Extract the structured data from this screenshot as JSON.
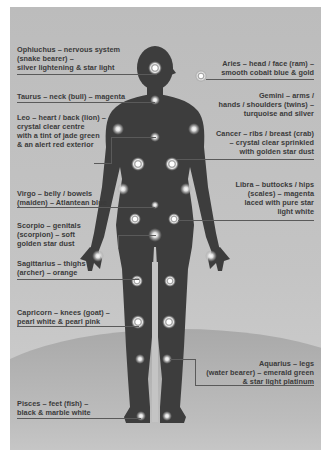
{
  "diagram": {
    "type": "zodiac-body-chakra-map",
    "colors": {
      "background": "#c2c2c2",
      "silhouette": "#3d3d3d",
      "text": "#3a3a3a",
      "leader_line": "#5a5a5a",
      "glow": "#ffffff"
    },
    "labels_left": [
      {
        "id": "ophiuchus",
        "lines": [
          "Ophiuchus – nervous system",
          "(snake bearer) –",
          "silver lightening & star light"
        ]
      },
      {
        "id": "taurus",
        "lines": [
          "Taurus – neck (bull) – magenta"
        ]
      },
      {
        "id": "leo",
        "lines": [
          "Leo – heart / back (lion) –",
          "crystal clear centre",
          "with a tint of jade green",
          "& an alert red exterior"
        ]
      },
      {
        "id": "virgo",
        "lines": [
          "Virgo – belly / bowels",
          "(maiden) – Atlantean blue"
        ]
      },
      {
        "id": "scorpio",
        "lines": [
          "Scorpio – genitals",
          "(scorpion) – soft",
          "golden star dust"
        ]
      },
      {
        "id": "sagittarius",
        "lines": [
          "Sagittarius – thighs",
          "(archer) – orange"
        ]
      },
      {
        "id": "capricorn",
        "lines": [
          "Capricorn – knees (goat) –",
          "pearl white & pearl pink"
        ]
      },
      {
        "id": "pisces",
        "lines": [
          "Pisces – feet (fish) –",
          "black & marble white"
        ]
      }
    ],
    "labels_right": [
      {
        "id": "aries",
        "lines": [
          "Aries – head / face (ram) –",
          "smooth cobalt blue & gold"
        ]
      },
      {
        "id": "gemini",
        "lines": [
          "Gemini – arms /",
          "hands / shoulders (twins) –",
          "turquoise and silver"
        ]
      },
      {
        "id": "cancer",
        "lines": [
          "Cancer – ribs / breast (crab)",
          "– crystal clear sprinkled",
          "with golden star dust"
        ]
      },
      {
        "id": "libra",
        "lines": [
          "Libra – buttocks / hips",
          "(scales) – magenta",
          "laced with pure star",
          "light white"
        ]
      },
      {
        "id": "aquarius",
        "lines": [
          "Aquarius – legs",
          "(water bearer) – emerald green",
          "& star light platinum"
        ]
      }
    ]
  }
}
